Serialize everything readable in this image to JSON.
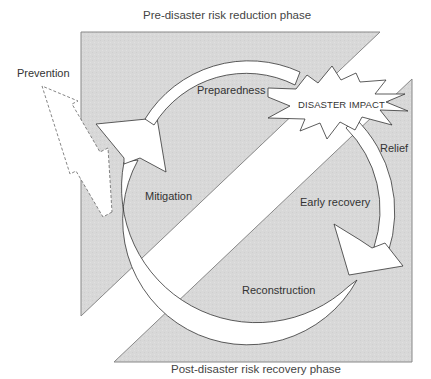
{
  "diagram": {
    "title_top": "Pre-disaster risk reduction phase",
    "title_bottom": "Post-disaster risk recovery phase",
    "center_event": "DISASTER IMPACT",
    "stages": {
      "prevention": "Prevention",
      "mitigation": "Mitigation",
      "preparedness": "Preparedness",
      "relief": "Relief",
      "early_recovery": "Early recovery",
      "reconstruction": "Reconstruction"
    },
    "colors": {
      "panel_fill": "#d9d9d9",
      "stroke": "#444444",
      "band_fill": "#ffffff",
      "text": "#333333"
    }
  }
}
